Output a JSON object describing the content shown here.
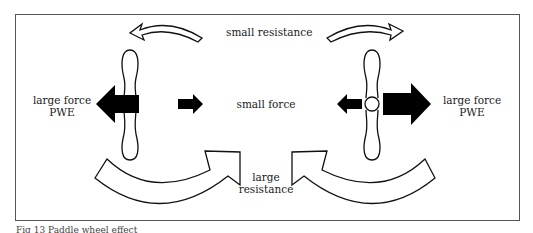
{
  "figure": {
    "labels": {
      "top_center": "small resistance",
      "middle_center": "small force",
      "left_force_line1": "large force",
      "left_force_line2": "PWE",
      "right_force_line1": "large force",
      "right_force_line2": "PWE",
      "bottom_center_line1": "large",
      "bottom_center_line2": "resistance"
    },
    "caption": "Fig 13  Paddle wheel effect",
    "colors": {
      "stroke": "#111111",
      "fill_arrow": "#000000",
      "fill_open": "#ffffff",
      "frame": "#555555"
    }
  }
}
